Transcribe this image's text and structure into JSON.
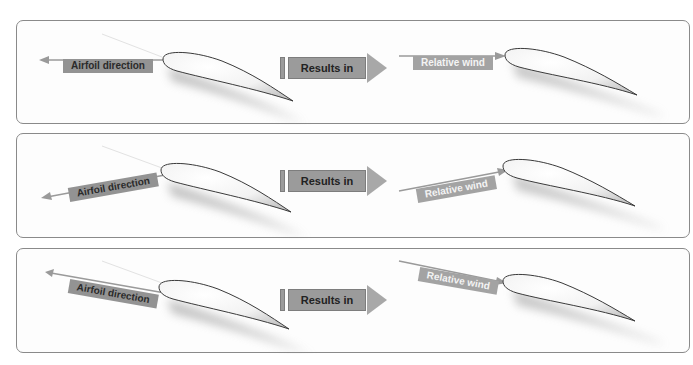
{
  "panels": [
    {
      "id": "level",
      "airfoil_direction_label": "Airfoil direction",
      "results_label": "Results in",
      "relative_wind_label": "Relative wind"
    },
    {
      "id": "climbing",
      "airfoil_direction_label": "Airfoil direction",
      "results_label": "Results in",
      "relative_wind_label": "Relative wind"
    },
    {
      "id": "descending",
      "airfoil_direction_label": "Airfoil direction",
      "results_label": "Results in",
      "relative_wind_label": "Relative wind"
    }
  ],
  "colors": {
    "label_bg": "#939393",
    "wind_label_bg": "#a3a3a3",
    "arrow": "#9a9a9a",
    "panel_border": "#8a8a8a"
  }
}
